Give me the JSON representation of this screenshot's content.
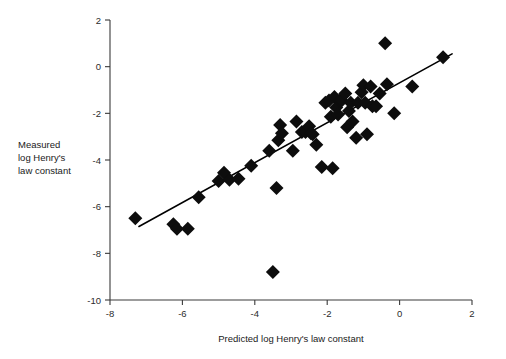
{
  "chart_data": {
    "type": "scatter",
    "title": "",
    "xlabel": "Predicted log Henry's law constant",
    "ylabel": "Measured log Henry's law constant",
    "ylabel_lines": [
      "Measured",
      "log Henry's",
      "law constant"
    ],
    "xlim": [
      -8,
      2
    ],
    "ylim": [
      -10,
      2
    ],
    "xticks": [
      -8,
      -6,
      -4,
      -2,
      0,
      2
    ],
    "xtick_labels": [
      "-8",
      "-6",
      "-4",
      "-2",
      "0",
      "2"
    ],
    "yticks": [
      2,
      0,
      -2,
      -4,
      -6,
      -8,
      -10
    ],
    "ytick_labels": [
      "2",
      "0",
      "-2",
      "-4",
      "-6",
      "-8",
      "-10"
    ],
    "grid": false,
    "legend": false,
    "marker": "diamond",
    "marker_color": "#0d0d0d",
    "marker_size": 7,
    "points": [
      {
        "x": -7.3,
        "y": -6.5
      },
      {
        "x": -6.25,
        "y": -6.75
      },
      {
        "x": -6.15,
        "y": -6.95
      },
      {
        "x": -5.85,
        "y": -6.95
      },
      {
        "x": -5.55,
        "y": -5.6
      },
      {
        "x": -5.0,
        "y": -4.9
      },
      {
        "x": -4.85,
        "y": -4.55
      },
      {
        "x": -4.7,
        "y": -4.85
      },
      {
        "x": -4.45,
        "y": -4.8
      },
      {
        "x": -4.1,
        "y": -4.25
      },
      {
        "x": -3.6,
        "y": -3.6
      },
      {
        "x": -3.5,
        "y": -8.8
      },
      {
        "x": -3.4,
        "y": -5.2
      },
      {
        "x": -3.35,
        "y": -3.15
      },
      {
        "x": -3.3,
        "y": -2.5
      },
      {
        "x": -3.25,
        "y": -2.85
      },
      {
        "x": -2.95,
        "y": -3.6
      },
      {
        "x": -2.85,
        "y": -2.35
      },
      {
        "x": -2.7,
        "y": -2.8
      },
      {
        "x": -2.6,
        "y": -2.8
      },
      {
        "x": -2.5,
        "y": -2.55
      },
      {
        "x": -2.45,
        "y": -2.85
      },
      {
        "x": -2.4,
        "y": -2.9
      },
      {
        "x": -2.3,
        "y": -3.35
      },
      {
        "x": -2.15,
        "y": -4.3
      },
      {
        "x": -2.05,
        "y": -1.55
      },
      {
        "x": -1.95,
        "y": -1.45
      },
      {
        "x": -1.9,
        "y": -2.15
      },
      {
        "x": -1.85,
        "y": -4.35
      },
      {
        "x": -1.8,
        "y": -1.3
      },
      {
        "x": -1.75,
        "y": -1.75
      },
      {
        "x": -1.7,
        "y": -2.05
      },
      {
        "x": -1.65,
        "y": -1.45
      },
      {
        "x": -1.6,
        "y": -1.45
      },
      {
        "x": -1.5,
        "y": -1.15
      },
      {
        "x": -1.45,
        "y": -2.6
      },
      {
        "x": -1.4,
        "y": -1.9
      },
      {
        "x": -1.35,
        "y": -1.55
      },
      {
        "x": -1.3,
        "y": -2.35
      },
      {
        "x": -1.2,
        "y": -3.05
      },
      {
        "x": -1.15,
        "y": -1.55
      },
      {
        "x": -1.05,
        "y": -1.1
      },
      {
        "x": -1.0,
        "y": -0.8
      },
      {
        "x": -0.95,
        "y": -1.55
      },
      {
        "x": -0.9,
        "y": -2.9
      },
      {
        "x": -0.8,
        "y": -0.85
      },
      {
        "x": -0.75,
        "y": -1.7
      },
      {
        "x": -0.65,
        "y": -1.7
      },
      {
        "x": -0.55,
        "y": -1.15
      },
      {
        "x": -0.4,
        "y": 1.0
      },
      {
        "x": -0.35,
        "y": -0.75
      },
      {
        "x": -0.15,
        "y": -2.0
      },
      {
        "x": 0.35,
        "y": -0.85
      },
      {
        "x": 1.2,
        "y": 0.4
      }
    ],
    "fit_line": {
      "x_start": -7.2,
      "y_start": -6.85,
      "x_end": 1.45,
      "y_end": 0.55,
      "color": "#000000"
    }
  }
}
